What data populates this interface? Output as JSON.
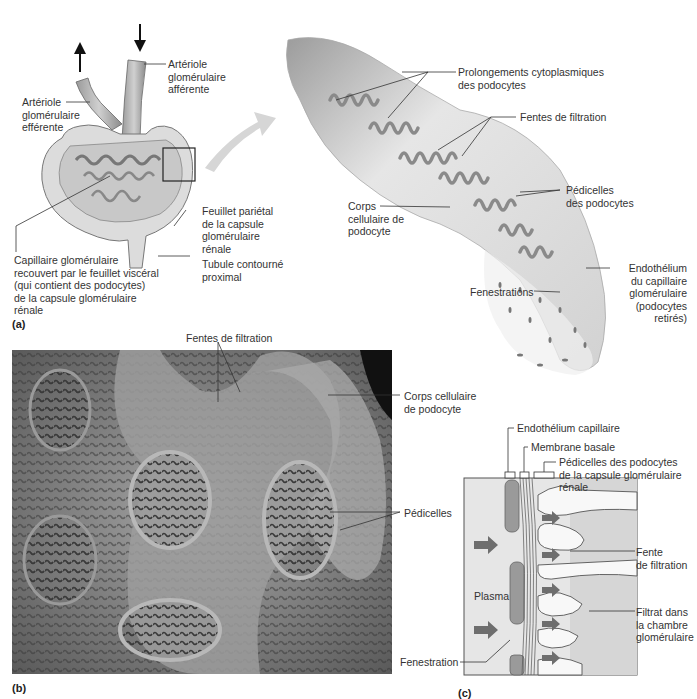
{
  "figure": {
    "panel_a": {
      "tag": "(a)",
      "overview_labels": {
        "afferent": [
          "Artériole",
          "glomérulaire",
          "afférente"
        ],
        "efferent": [
          "Artériole",
          "glomérulaire",
          "efférente"
        ],
        "parietal": [
          "Feuillet pariétal",
          "de la capsule",
          "glomérulaire",
          "rénale"
        ],
        "tubule": [
          "Tubule contourné",
          "proximal"
        ],
        "capillary": [
          "Capillaire glomérulaire",
          "recouvert par le feuillet viscéral",
          "(qui contient des podocytes)",
          "de la capsule glomérulaire",
          "rénale"
        ]
      },
      "detail_labels": {
        "processes": [
          "Prolongements cytoplasmiques",
          "des podocytes"
        ],
        "slits": [
          "Fentes de filtration"
        ],
        "pedicels": [
          "Pédicelles",
          "des podocytes"
        ],
        "cell_body": [
          "Corps",
          "cellulaire de",
          "podocyte"
        ],
        "endothelium": [
          "Endothélium",
          "du capillaire",
          "glomérulaire",
          "(podocytes",
          "retirés)"
        ],
        "fenestrations": [
          "Fenestrations"
        ]
      }
    },
    "panel_b": {
      "tag": "(b)",
      "labels": {
        "slits": "Fentes de filtration",
        "cell_body": [
          "Corps cellulaire",
          "de podocyte"
        ],
        "pedicels": "Pédicelles"
      }
    },
    "panel_c": {
      "tag": "(c)",
      "labels": {
        "endothelium": "Endothélium capillaire",
        "basement": "Membrane basale",
        "pedicels": [
          "Pédicelles des podocytes",
          "de la capsule glomérulaire",
          "rénale"
        ],
        "slit": [
          "Fente",
          "de filtration"
        ],
        "filtrate": [
          "Filtrat dans",
          "la chambre",
          "glomérulaire"
        ],
        "plasma": "Plasma",
        "fenestration": "Fenestration"
      }
    },
    "colors": {
      "tissue_dark": "#8a8a8a",
      "tissue_mid": "#b4b4b4",
      "tissue_light": "#e4e4e4",
      "arrow": "#6e6e6e",
      "leader_line": "#333333",
      "sem_bg": "#4a4a4a"
    }
  }
}
